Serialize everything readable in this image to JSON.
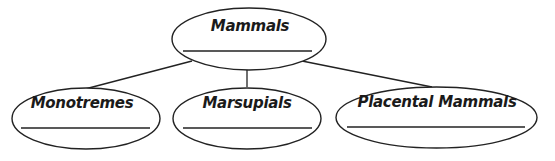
{
  "diagram": {
    "type": "concept-map",
    "root": {
      "label": "Mammals",
      "answer_blank": ""
    },
    "children": [
      {
        "label": "Monotremes",
        "answer_blank": ""
      },
      {
        "label": "Marsupials",
        "answer_blank": ""
      },
      {
        "label": "Placental Mammals",
        "answer_blank": ""
      }
    ],
    "colors": {
      "stroke": "#222222",
      "text": "#1a1a1a",
      "background": "#ffffff"
    }
  }
}
